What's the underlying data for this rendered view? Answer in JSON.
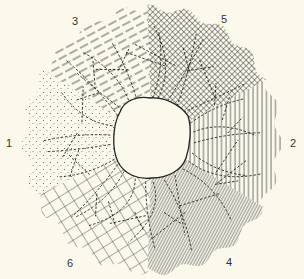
{
  "figure": {
    "background": "#fbf9ec",
    "ink": "#2a2a2a",
    "center": [
      152,
      140
    ],
    "outer_radius": [
      127,
      132
    ],
    "sectors": [
      {
        "id": "1",
        "label": "1",
        "pattern": "stipple-dots",
        "start_deg": 155,
        "end_deg": 212,
        "label_pos": [
          6,
          138
        ]
      },
      {
        "id": "3",
        "label": "3",
        "pattern": "diagonal-dashes",
        "start_deg": 212,
        "end_deg": 268,
        "label_pos": [
          72,
          16
        ]
      },
      {
        "id": "5",
        "label": "5",
        "pattern": "fine-crosshatch",
        "start_deg": 268,
        "end_deg": 333,
        "label_pos": [
          221,
          14
        ]
      },
      {
        "id": "2",
        "label": "2",
        "pattern": "vertical-lines",
        "start_deg": 333,
        "end_deg": 30,
        "label_pos": [
          290,
          138
        ]
      },
      {
        "id": "4",
        "label": "4",
        "pattern": "dense-diagonal-lines",
        "start_deg": 30,
        "end_deg": 92,
        "label_pos": [
          226,
          257
        ]
      },
      {
        "id": "6",
        "label": "6",
        "pattern": "square-grid",
        "start_deg": 92,
        "end_deg": 155,
        "label_pos": [
          67,
          258
        ]
      }
    ],
    "center_hole": {
      "shape": "irregular-blob",
      "radius": 38
    }
  }
}
